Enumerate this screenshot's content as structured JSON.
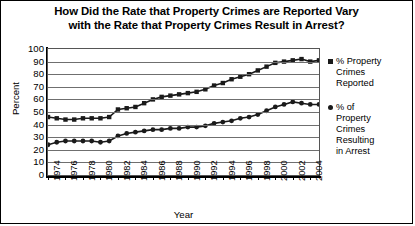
{
  "chart_data": {
    "type": "line",
    "title": "How Did the Rate that Property Crimes are Reported Vary with the Rate that Property Crimes Result in Arrest?",
    "title_line1": "How Did the Rate that Property Crimes are Reported Vary",
    "title_line2": "with the Rate that Property Crimes Result in Arrest?",
    "xlabel": "Year",
    "ylabel": "Percent",
    "ylim": [
      0,
      100
    ],
    "ytick_values": [
      0,
      10,
      20,
      30,
      40,
      50,
      60,
      70,
      80,
      90,
      100
    ],
    "ytick_labels": [
      "0",
      "10",
      "20",
      "30",
      "40",
      "50",
      "60",
      "70",
      "80",
      "90",
      "100"
    ],
    "grid": true,
    "legend_position": "right",
    "xlim": [
      1974,
      2005
    ],
    "x": [
      1974,
      1975,
      1976,
      1977,
      1978,
      1979,
      1980,
      1981,
      1982,
      1983,
      1984,
      1985,
      1986,
      1987,
      1988,
      1989,
      1990,
      1991,
      1992,
      1993,
      1994,
      1995,
      1996,
      1997,
      1998,
      1999,
      2000,
      2001,
      2002,
      2003,
      2004,
      2005
    ],
    "xtick_labels": [
      "1974",
      "1976",
      "1978",
      "1980",
      "1982",
      "1984",
      "1986",
      "1988",
      "1990",
      "1992",
      "1994",
      "1996",
      "1998",
      "2000",
      "2002",
      "2004"
    ],
    "xtick_values": [
      1974,
      1976,
      1978,
      1980,
      1982,
      1984,
      1986,
      1988,
      1990,
      1992,
      1994,
      1996,
      1998,
      2000,
      2002,
      2004
    ],
    "series": [
      {
        "name": "% Property Crimes Reported",
        "legend_label_lines": [
          "% Property",
          "Crimes",
          "Reported"
        ],
        "marker": "square",
        "color": "#1a1a1a",
        "values": [
          46,
          45,
          44,
          44,
          45,
          45,
          45,
          46,
          52,
          53,
          54,
          57,
          60,
          62,
          63,
          64,
          65,
          66,
          68,
          71,
          73,
          76,
          78,
          80,
          83,
          86,
          89,
          90,
          91,
          92,
          90,
          91
        ]
      },
      {
        "name": "% of Property Crimes Resulting in Arrest",
        "legend_label_lines": [
          "% of",
          "Property",
          "Crimes",
          "Resulting",
          "in Arrest"
        ],
        "marker": "circle",
        "color": "#1a1a1a",
        "values": [
          24,
          26,
          27,
          27,
          27,
          27,
          26,
          27,
          31,
          33,
          34,
          35,
          36,
          36,
          37,
          37,
          38,
          38,
          39,
          41,
          42,
          43,
          45,
          46,
          48,
          51,
          54,
          56,
          58,
          57,
          56,
          56
        ]
      }
    ]
  }
}
